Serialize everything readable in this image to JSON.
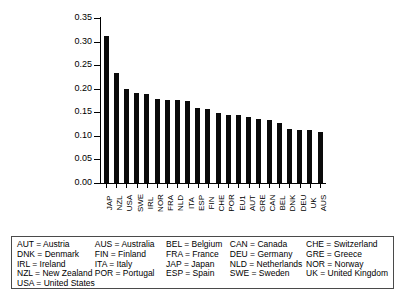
{
  "chart_data": {
    "type": "bar",
    "title": "",
    "subtitle": "",
    "xlabel": "",
    "ylabel": "",
    "ylim": [
      0.0,
      0.35
    ],
    "ytick_labels": [
      "0.35",
      "0.30",
      "0.25",
      "0.20",
      "0.15",
      "0.10",
      "0.05",
      "0.00"
    ],
    "ytick_values": [
      0.35,
      0.3,
      0.25,
      0.2,
      0.15,
      0.1,
      0.05,
      0.0
    ],
    "grid": false,
    "legend_position": "below-plot-table",
    "bar_color": "#0a0a0a",
    "categories": [
      "JAP",
      "NZL",
      "USA",
      "SWE",
      "IRL",
      "NOR",
      "FRA",
      "NLD",
      "ITA",
      "ESP",
      "FIN",
      "CHE",
      "POR",
      "EU1",
      "AUT",
      "GRE",
      "CAN",
      "BEL",
      "DNK",
      "DEU",
      "UK",
      "AUS"
    ],
    "values": [
      0.312,
      0.233,
      0.2,
      0.19,
      0.189,
      0.178,
      0.177,
      0.176,
      0.175,
      0.16,
      0.157,
      0.148,
      0.145,
      0.144,
      0.14,
      0.136,
      0.133,
      0.128,
      0.115,
      0.113,
      0.112,
      0.108
    ]
  },
  "legend": {
    "columns": [
      {
        "entries": [
          "AUT = Austria",
          "DNK = Denmark",
          "IRL = Ireland",
          "NZL = New Zealand",
          "USA = United States"
        ]
      },
      {
        "entries": [
          "AUS = Australia",
          "FIN = Finland",
          "ITA = Italy",
          "POR = Portugal"
        ]
      },
      {
        "entries": [
          "BEL = Belgium",
          "FRA = France",
          "JAP = Japan",
          "ESP = Spain"
        ]
      },
      {
        "entries": [
          "CAN = Canada",
          "DEU = Germany",
          "NLD = Netherlands",
          "SWE = Sweden"
        ]
      },
      {
        "entries": [
          "CHE = Switzerland",
          "GRE = Greece",
          "NOR = Norway",
          "UK = United Kingdom"
        ]
      }
    ]
  }
}
